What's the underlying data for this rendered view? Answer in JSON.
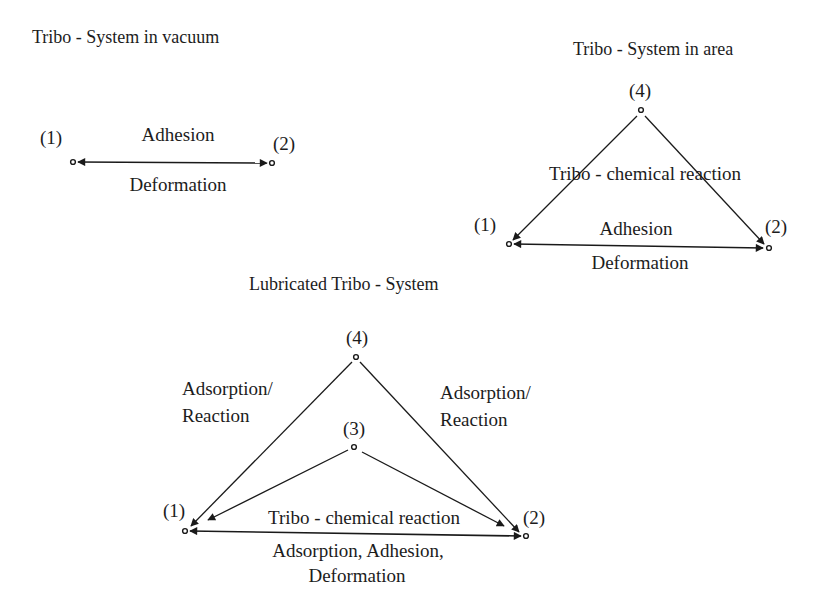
{
  "diagrams": {
    "vacuum": {
      "title": "Tribo - System in vacuum",
      "nodes": {
        "n1": "(1)",
        "n2": "(2)"
      },
      "edge_top": "Adhesion",
      "edge_bottom": "Deformation"
    },
    "area": {
      "title": "Tribo - System in area",
      "nodes": {
        "n1": "(1)",
        "n2": "(2)",
        "n4": "(4)"
      },
      "middle": "Tribo - chemical reaction",
      "edge_top": "Adhesion",
      "edge_bottom": "Deformation"
    },
    "lubricated": {
      "title": "Lubricated Tribo - System",
      "nodes": {
        "n1": "(1)",
        "n2": "(2)",
        "n3": "(3)",
        "n4": "(4)"
      },
      "left_side": [
        "Adsorption/",
        "Reaction"
      ],
      "right_side": [
        "Adsorption/",
        "Reaction"
      ],
      "middle": "Tribo - chemical reaction",
      "edge_bottom": [
        "Adsorption, Adhesion,",
        "Deformation"
      ]
    }
  },
  "colors": {
    "line": "#1a1a1a",
    "text": "#1c1c1c",
    "background": "#ffffff"
  }
}
